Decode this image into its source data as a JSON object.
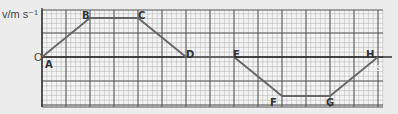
{
  "chart_data": {
    "type": "line",
    "title": "",
    "xlabel": "t/s",
    "ylabel": "v/m s-1",
    "origin_label": "O",
    "grid": true,
    "points": [
      {
        "label": "A",
        "x": 0,
        "y": 0
      },
      {
        "label": "B",
        "x": 2,
        "y": 1
      },
      {
        "label": "C",
        "x": 4,
        "y": 1
      },
      {
        "label": "D",
        "x": 6,
        "y": 0
      },
      {
        "label": "E",
        "x": 8,
        "y": 0
      },
      {
        "label": "F",
        "x": 10,
        "y": -1
      },
      {
        "label": "G",
        "x": 12,
        "y": -1
      },
      {
        "label": "H",
        "x": 14,
        "y": 0
      }
    ],
    "note": "Axis values unlabeled; positions given in major-grid units"
  },
  "labels": {
    "y_axis": "v/m s⁻¹",
    "x_axis": "t/s",
    "origin": "O",
    "A": "A",
    "B": "B",
    "C": "C",
    "D": "D",
    "E": "E",
    "F": "F",
    "G": "G",
    "H": "H"
  },
  "colors": {
    "background": "#ececec",
    "grid_minor": "#b8b8b8",
    "grid_major": "#555555",
    "line": "#666666"
  }
}
